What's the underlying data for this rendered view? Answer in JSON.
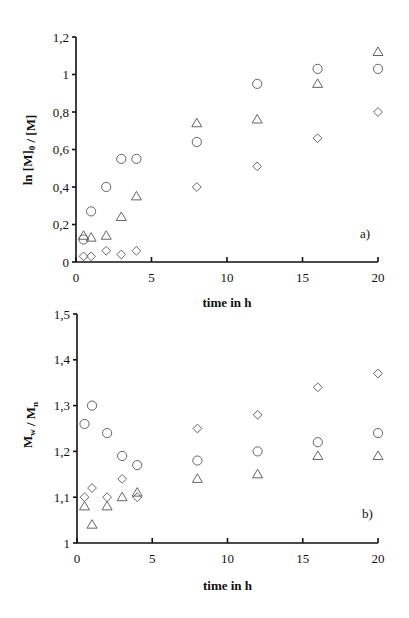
{
  "chart_data": [
    {
      "type": "scatter",
      "panel_label": "a)",
      "title": "",
      "xlabel": "time in h",
      "ylabel": "ln [M]0 / [M]",
      "xlim": [
        0,
        20
      ],
      "ylim": [
        0,
        1.2
      ],
      "xticks": [
        0,
        5,
        10,
        15,
        20
      ],
      "xtick_labels": [
        "0",
        "5",
        "10",
        "15",
        "20"
      ],
      "yticks": [
        0,
        0.2,
        0.4,
        0.6,
        0.8,
        1,
        1.2
      ],
      "ytick_labels": [
        "0",
        "0,2",
        "0,4",
        "0,6",
        "0,8",
        "1",
        "1,2"
      ],
      "grid": false,
      "legend": "none",
      "series": [
        {
          "name": "circles",
          "marker": "circle",
          "x": [
            0.5,
            1,
            2,
            3,
            4,
            8,
            12,
            16,
            20
          ],
          "y": [
            0.12,
            0.27,
            0.4,
            0.55,
            0.55,
            0.64,
            0.95,
            1.03,
            1.03
          ]
        },
        {
          "name": "triangles",
          "marker": "triangle",
          "x": [
            0.5,
            1,
            2,
            3,
            4,
            8,
            12,
            16,
            20
          ],
          "y": [
            0.14,
            0.13,
            0.14,
            0.24,
            0.35,
            0.74,
            0.76,
            0.95,
            1.12
          ]
        },
        {
          "name": "diamonds",
          "marker": "diamond",
          "x": [
            0.5,
            1,
            2,
            3,
            4,
            8,
            12,
            16,
            20
          ],
          "y": [
            0.03,
            0.03,
            0.06,
            0.04,
            0.06,
            0.4,
            0.51,
            0.66,
            0.8
          ]
        }
      ]
    },
    {
      "type": "scatter",
      "panel_label": "b)",
      "title": "",
      "xlabel": "time in h",
      "ylabel": "Mw / Mn",
      "xlim": [
        0,
        20
      ],
      "ylim": [
        1,
        1.5
      ],
      "xticks": [
        0,
        5,
        10,
        15,
        20
      ],
      "xtick_labels": [
        "0",
        "5",
        "10",
        "15",
        "20"
      ],
      "yticks": [
        1,
        1.1,
        1.2,
        1.3,
        1.4,
        1.5
      ],
      "ytick_labels": [
        "1",
        "1,1",
        "1,2",
        "1,3",
        "1,4",
        "1,5"
      ],
      "grid": false,
      "legend": "none",
      "series": [
        {
          "name": "circles",
          "marker": "circle",
          "x": [
            0.5,
            1,
            2,
            3,
            4,
            8,
            12,
            16,
            20
          ],
          "y": [
            1.26,
            1.3,
            1.24,
            1.19,
            1.17,
            1.18,
            1.2,
            1.22,
            1.24
          ]
        },
        {
          "name": "triangles",
          "marker": "triangle",
          "x": [
            0.5,
            1,
            2,
            3,
            4,
            8,
            12,
            16,
            20
          ],
          "y": [
            1.08,
            1.04,
            1.08,
            1.1,
            1.11,
            1.14,
            1.15,
            1.19,
            1.19
          ]
        },
        {
          "name": "diamonds",
          "marker": "diamond",
          "x": [
            0.5,
            1,
            2,
            3,
            4,
            8,
            12,
            16,
            20
          ],
          "y": [
            1.1,
            1.12,
            1.1,
            1.14,
            1.1,
            1.25,
            1.28,
            1.34,
            1.37
          ]
        }
      ]
    }
  ],
  "layout": {
    "panels": [
      {
        "x0": 76,
        "x1": 378,
        "y_bottom": 262,
        "y_top": 37,
        "ylabel_x": 32,
        "ylabel_y": 150,
        "xlabel_y": 307,
        "panel_label_x": 360,
        "panel_label_y": 238
      },
      {
        "x0": 77,
        "x1": 378,
        "y_bottom": 543,
        "y_top": 314,
        "ylabel_x": 32,
        "ylabel_y": 425,
        "xlabel_y": 590,
        "panel_label_x": 362,
        "panel_label_y": 518
      }
    ]
  }
}
